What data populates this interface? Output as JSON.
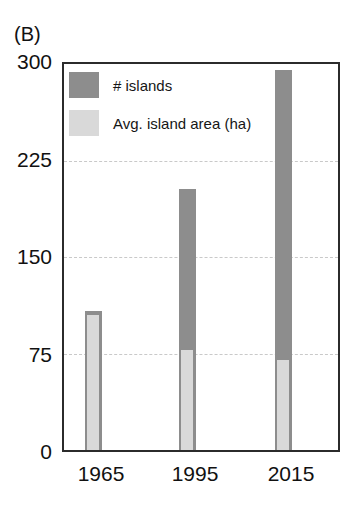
{
  "panel": {
    "label": "(B)"
  },
  "colors": {
    "series_islands": "#8d8d8d",
    "series_area": "#d9d9d9",
    "axis": "#2b2b2b",
    "gridline": "#c9c9c9",
    "background": "#ffffff"
  },
  "legend": {
    "position": "top-left-inside",
    "entries": [
      {
        "label": "# islands",
        "swatch": "#8d8d8d"
      },
      {
        "label": "Avg. island area (ha)",
        "swatch": "#d9d9d9"
      }
    ]
  },
  "axes": {
    "y_ticks": [
      "300",
      "225",
      "150",
      "75",
      "0"
    ],
    "x_ticks": [
      "1965",
      "1995",
      "2015"
    ],
    "ylabel": "",
    "xlabel": ""
  },
  "chart_data": {
    "type": "bar",
    "title": "(B)",
    "subtitle": "",
    "categories": [
      "1965",
      "1995",
      "2015"
    ],
    "series": [
      {
        "name": "# islands",
        "values": [
          108,
          203,
          295
        ],
        "color": "#8d8d8d"
      },
      {
        "name": "Avg. island area (ha)",
        "values": [
          105,
          78,
          70
        ],
        "color": "#d9d9d9"
      }
    ],
    "xlabel": "",
    "ylabel": "",
    "ylim": [
      0,
      300
    ],
    "yticks": [
      0,
      75,
      150,
      225,
      300
    ],
    "grid": true,
    "grid_axis": "y",
    "grid_style": "dashed",
    "legend_position": "upper-left-inside",
    "bar_overlap": true
  }
}
